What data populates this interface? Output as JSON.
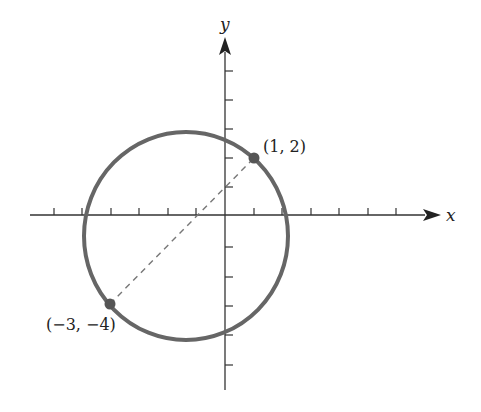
{
  "diagram": {
    "type": "coordinate-plane-circle",
    "axes": {
      "x_label": "x",
      "y_label": "y",
      "x_ticks": [
        -6,
        -5,
        -4,
        -3,
        -2,
        -1,
        1,
        2,
        3,
        4,
        5,
        6
      ],
      "y_ticks": [
        -6,
        -5,
        -4,
        -3,
        -2,
        -1,
        1,
        2,
        3,
        4,
        5
      ]
    },
    "circle": {
      "center": [
        -1,
        -1
      ],
      "endpoints_of_diameter": [
        [
          1,
          2
        ],
        [
          -3,
          -4
        ]
      ]
    },
    "points": [
      {
        "label": "(1, 2)",
        "x": 1,
        "y": 2
      },
      {
        "label": "(−3, −4)",
        "x": -3,
        "y": -4
      }
    ],
    "colors": {
      "axis": "#333333",
      "circle": "#666666",
      "point": "#555555",
      "dashed": "#777777"
    }
  }
}
